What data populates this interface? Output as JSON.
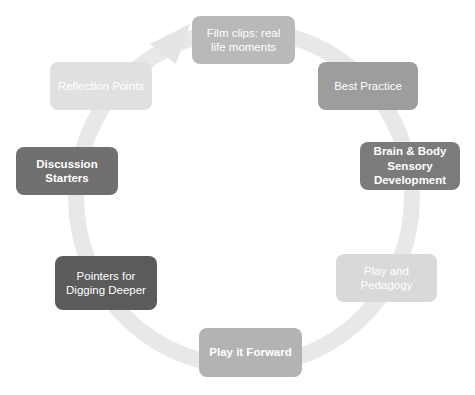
{
  "diagram": {
    "type": "cycle",
    "nodes": [
      {
        "id": "film",
        "label": "Film clips: real life moments",
        "color": "#b9b9b9",
        "bold": false
      },
      {
        "id": "best",
        "label": "Best Practice",
        "color": "#9d9d9d",
        "bold": false
      },
      {
        "id": "brain",
        "label": "Brain & Body Sensory Development",
        "color": "#7b7b7b",
        "bold": true
      },
      {
        "id": "play",
        "label": "Play and Pedagogy",
        "color": "#d9d9d9",
        "bold": false
      },
      {
        "id": "forward",
        "label": "Play it Forward",
        "color": "#b3b3b3",
        "bold": true
      },
      {
        "id": "pointers",
        "label": "Pointers for Digging Deeper",
        "color": "#5b5b5b",
        "bold": false
      },
      {
        "id": "discussion",
        "label": "Discussion Starters",
        "color": "#707070",
        "bold": true
      },
      {
        "id": "reflection",
        "label": "Reflection Points",
        "color": "#e0e0e0",
        "bold": false
      }
    ],
    "ring_color": "#e6e6e6",
    "arrow_direction": "clockwise"
  }
}
